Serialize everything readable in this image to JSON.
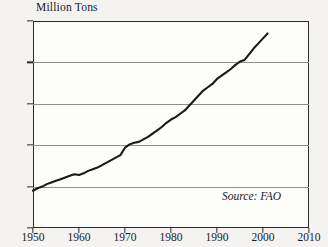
{
  "chart_data": {
    "type": "line",
    "title": "",
    "ylabel": "Million Tons",
    "xlabel": "",
    "xlim": [
      1950,
      2010
    ],
    "ylim": [
      0,
      250
    ],
    "grid": true,
    "legend": false,
    "annotation": "Source: FAO",
    "y_ticks": [
      0,
      50,
      100,
      150,
      200,
      250
    ],
    "y_tick_labels": [
      "0",
      "50",
      "100",
      "150",
      "200",
      "250"
    ],
    "x_ticks": [
      1950,
      1960,
      1970,
      1980,
      1990,
      2000,
      2010
    ],
    "x_tick_labels": [
      "1950",
      "1960",
      "1970",
      "1980",
      "1990",
      "2000",
      "2010"
    ],
    "series": [
      {
        "name": "World Meat Production",
        "color": "#1a1a1a",
        "x": [
          1950,
          1951,
          1952,
          1953,
          1954,
          1955,
          1956,
          1957,
          1958,
          1959,
          1960,
          1961,
          1962,
          1963,
          1964,
          1965,
          1966,
          1967,
          1968,
          1969,
          1970,
          1971,
          1972,
          1973,
          1974,
          1975,
          1976,
          1977,
          1978,
          1979,
          1980,
          1981,
          1982,
          1983,
          1984,
          1985,
          1986,
          1987,
          1988,
          1989,
          1990,
          1991,
          1992,
          1993,
          1994,
          1995,
          1996,
          1997,
          1998,
          1999,
          2000,
          2001
        ],
        "values": [
          45,
          48,
          50,
          53,
          55,
          57,
          59,
          61,
          63,
          65,
          64,
          66,
          69,
          71,
          73,
          76,
          79,
          82,
          85,
          88,
          97,
          101,
          103,
          104,
          107,
          110,
          114,
          118,
          122,
          127,
          131,
          134,
          138,
          142,
          148,
          154,
          160,
          166,
          170,
          174,
          180,
          184,
          188,
          192,
          197,
          201,
          203,
          210,
          217,
          223,
          229,
          235
        ]
      }
    ]
  },
  "axis_title": {
    "text": "Million Tons"
  },
  "source": {
    "text": "Source: FAO"
  }
}
